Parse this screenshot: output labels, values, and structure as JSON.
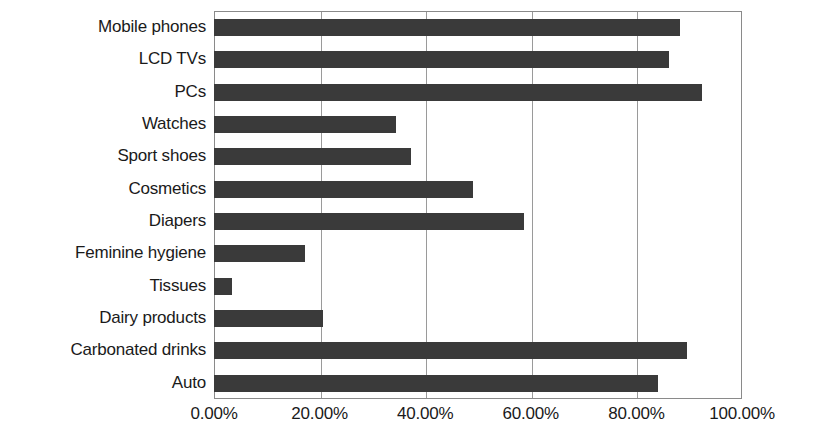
{
  "chart_data": {
    "type": "bar",
    "orientation": "horizontal",
    "title": "",
    "subtitle": "",
    "xlabel": "",
    "ylabel": "",
    "categories": [
      "Mobile phones",
      "LCD TVs",
      "PCs",
      "Watches",
      "Sport shoes",
      "Cosmetics",
      "Diapers",
      "Feminine hygiene",
      "Tissues",
      "Dairy products",
      "Carbonated drinks",
      "Auto"
    ],
    "values": [
      88.2,
      86.1,
      92.5,
      34.4,
      37.3,
      49.0,
      58.7,
      17.2,
      3.4,
      20.6,
      89.5,
      84.0
    ],
    "value_unit": "%",
    "xlim": [
      0,
      100
    ],
    "xticks": [
      0,
      20,
      40,
      60,
      80,
      100
    ],
    "xtick_labels": [
      "0.00%",
      "20.00%",
      "40.00%",
      "60.00%",
      "80.00%",
      "100.00%"
    ],
    "grid": "vertical",
    "legend": "none",
    "bar_color": "#3a3a3a",
    "axis_color": "#8a8a8a",
    "gridline_color": "#9a9a9a",
    "background_color": "#ffffff",
    "text_color": "#1a1a1a"
  }
}
